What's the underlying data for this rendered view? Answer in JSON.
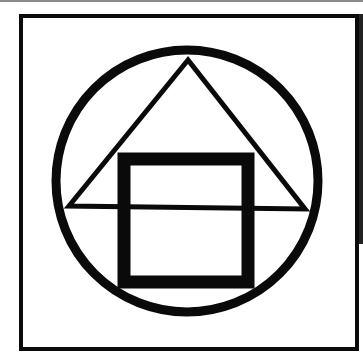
{
  "figure": {
    "colors": {
      "ink": "#0a0a0a",
      "paper": "#ffffff",
      "topline": "#8a8a8a"
    }
  }
}
